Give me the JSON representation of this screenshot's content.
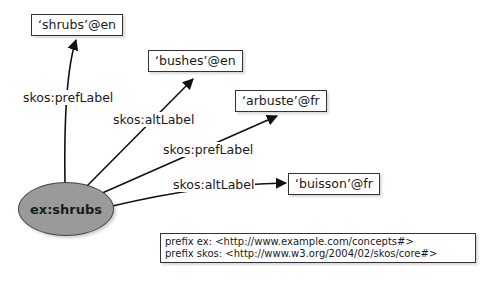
{
  "diagram": {
    "subject": {
      "label": "ex:shrubs",
      "color": "#9a9a9a"
    },
    "literals": [
      {
        "id": "shrubs",
        "label": "‘shrubs’@en"
      },
      {
        "id": "bushes",
        "label": "‘bushes’@en"
      },
      {
        "id": "arbuste",
        "label": "‘arbuste’@fr"
      },
      {
        "id": "buisson",
        "label": "‘buisson’@fr"
      }
    ],
    "edges": [
      {
        "from": "ex:shrubs",
        "to": "shrubs",
        "label": "skos:prefLabel"
      },
      {
        "from": "ex:shrubs",
        "to": "bushes",
        "label": "skos:altLabel"
      },
      {
        "from": "ex:shrubs",
        "to": "arbuste",
        "label": "skos:prefLabel"
      },
      {
        "from": "ex:shrubs",
        "to": "buisson",
        "label": "skos:altLabel"
      }
    ],
    "prefixes": [
      "prefix ex: <http://www.example.com/concepts#>",
      "prefix skos: <http://www.w3.org/2004/02/skos/core#>"
    ]
  }
}
